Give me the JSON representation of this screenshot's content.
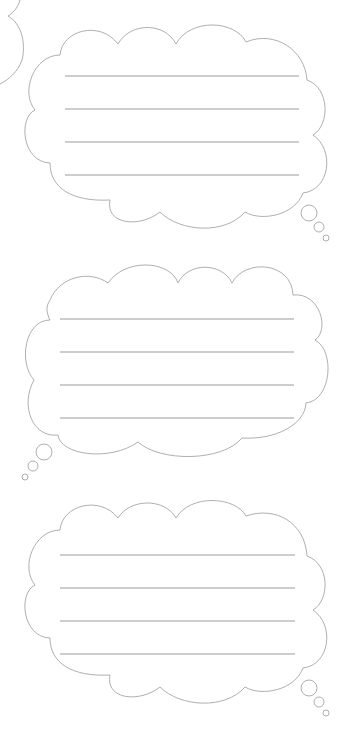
{
  "page": {
    "background": "#ffffff",
    "stroke_color": "#9a9a9a",
    "line_color": "#9c9c9c"
  },
  "bubbles": [
    {
      "id": "bubble-1",
      "lines": 4,
      "tail": "bottom-right"
    },
    {
      "id": "bubble-2",
      "lines": 4,
      "tail": "bottom-left"
    },
    {
      "id": "bubble-3",
      "lines": 4,
      "tail": "bottom-right"
    }
  ]
}
